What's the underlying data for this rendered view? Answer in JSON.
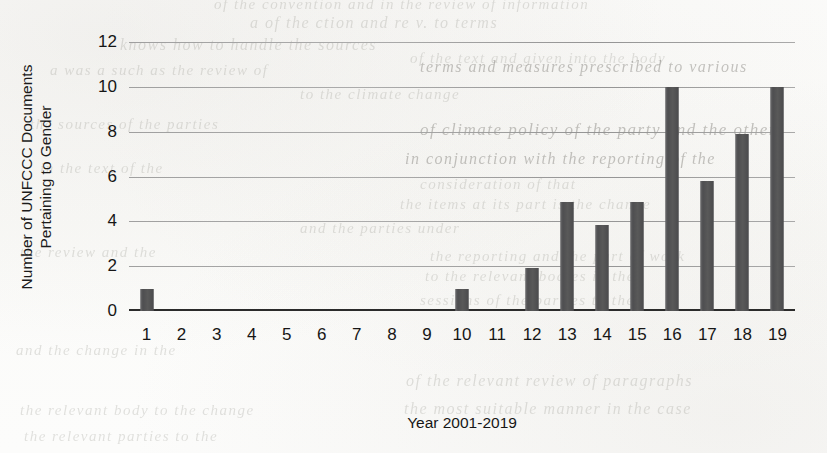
{
  "chart_data": {
    "type": "bar",
    "title": "",
    "xlabel": "Year 2001-2019",
    "ylabel_line1": "Number of UNFCCC Documents",
    "ylabel_line2": "Pertaining to Gender",
    "categories": [
      "1",
      "2",
      "3",
      "4",
      "5",
      "6",
      "7",
      "8",
      "9",
      "10",
      "11",
      "12",
      "13",
      "14",
      "15",
      "16",
      "17",
      "18",
      "19"
    ],
    "values": [
      1,
      0,
      0,
      0,
      0,
      0,
      0,
      0,
      0,
      1,
      0,
      1.9,
      4.85,
      3.85,
      4.85,
      10,
      5.8,
      7.9,
      10
    ],
    "ylim": [
      0,
      12
    ],
    "yticks": [
      "0",
      "2",
      "4",
      "6",
      "8",
      "10",
      "12"
    ],
    "ytick_values": [
      0,
      2,
      4,
      6,
      8,
      10,
      12
    ],
    "grid": true,
    "legend": "none",
    "bar_color": "#58585a",
    "gridline_color": "#9b9b9b",
    "axis_color": "#2b2b2b",
    "background_color": "#ffffff"
  },
  "ghost_text": {
    "lines": [
      {
        "t": "of the convention and in the review of information",
        "x": 214,
        "y": -4,
        "size": 15,
        "strong": false
      },
      {
        "t": "a of the  ction  and re v.  to  terms",
        "x": 250,
        "y": 14,
        "size": 16,
        "strong": false
      },
      {
        "t": "knows  how  to handle  the  sources",
        "x": 120,
        "y": 36,
        "size": 16,
        "strong": false
      },
      {
        "t": "of  the  text  and  given  into  the  body",
        "x": 410,
        "y": 50,
        "size": 15,
        "strong": false
      },
      {
        "t": "terms  and  measures  prescribed  to  various",
        "x": 420,
        "y": 58,
        "size": 16,
        "strong": true
      },
      {
        "t": "to  the  climate  change",
        "x": 300,
        "y": 86,
        "size": 15,
        "strong": false
      },
      {
        "t": "of climate  policy  of the  party  and  the  other",
        "x": 420,
        "y": 120,
        "size": 17,
        "strong": true
      },
      {
        "t": "in  conjunction  with  the  reporting  of  the",
        "x": 405,
        "y": 150,
        "size": 16,
        "strong": true
      },
      {
        "t": "consideration  of  that",
        "x": 420,
        "y": 176,
        "size": 15,
        "strong": false
      },
      {
        "t": "the  items  at  its  part  is  the  change",
        "x": 400,
        "y": 196,
        "size": 15,
        "strong": false
      },
      {
        "t": "and  the  parties  under",
        "x": 300,
        "y": 220,
        "size": 15,
        "strong": false
      },
      {
        "t": "the  reporting  and  the  part  of  work",
        "x": 430,
        "y": 248,
        "size": 15,
        "strong": false
      },
      {
        "t": "to  the  relevant  bodies  in  the",
        "x": 425,
        "y": 268,
        "size": 15,
        "strong": false
      },
      {
        "t": "sessions  of  the  parties  to  the",
        "x": 420,
        "y": 292,
        "size": 15,
        "strong": false
      },
      {
        "t": "of  the  relevant  review  of  paragraphs",
        "x": 406,
        "y": 372,
        "size": 16,
        "strong": false
      },
      {
        "t": "the  most  suitable  manner  in  the  case",
        "x": 404,
        "y": 400,
        "size": 16,
        "strong": false
      },
      {
        "t": "a  was  a  such  as  the  review  of",
        "x": 50,
        "y": 62,
        "size": 15,
        "strong": false
      },
      {
        "t": "the  sources  of  the  parties",
        "x": 30,
        "y": 116,
        "size": 15,
        "strong": false
      },
      {
        "t": "in  the  text  of  the",
        "x": 40,
        "y": 160,
        "size": 15,
        "strong": false
      },
      {
        "t": "the  review  and  the",
        "x": 20,
        "y": 244,
        "size": 15,
        "strong": false
      },
      {
        "t": "and  the  change  in  the",
        "x": 16,
        "y": 342,
        "size": 15,
        "strong": false
      },
      {
        "t": "the  relevant  body  to  the  change",
        "x": 20,
        "y": 402,
        "size": 15,
        "strong": false
      },
      {
        "t": "the  relevant  parties  to  the",
        "x": 24,
        "y": 428,
        "size": 15,
        "strong": false
      }
    ]
  }
}
